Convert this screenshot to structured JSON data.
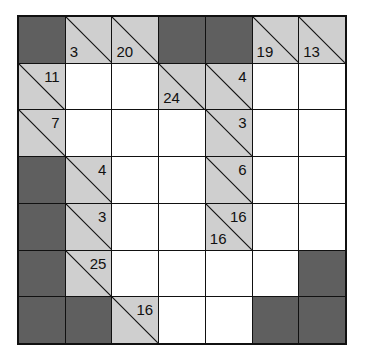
{
  "puzzle": {
    "type": "kakuro",
    "rows": 7,
    "cols": 7,
    "colors": {
      "block": "#5f5f5f",
      "clue": "#cfcfcf",
      "empty": "#ffffff",
      "line": "#111111"
    },
    "grid": [
      [
        {
          "t": "block"
        },
        {
          "t": "clue",
          "down": "3"
        },
        {
          "t": "clue",
          "down": "20"
        },
        {
          "t": "block"
        },
        {
          "t": "block"
        },
        {
          "t": "clue",
          "down": "19"
        },
        {
          "t": "clue",
          "down": "13"
        }
      ],
      [
        {
          "t": "clue",
          "across": "11"
        },
        {
          "t": "empty"
        },
        {
          "t": "empty"
        },
        {
          "t": "clue",
          "down": "24"
        },
        {
          "t": "clue",
          "across": "4"
        },
        {
          "t": "empty"
        },
        {
          "t": "empty"
        }
      ],
      [
        {
          "t": "clue",
          "across": "7"
        },
        {
          "t": "empty"
        },
        {
          "t": "empty"
        },
        {
          "t": "empty"
        },
        {
          "t": "clue",
          "across": "3"
        },
        {
          "t": "empty"
        },
        {
          "t": "empty"
        }
      ],
      [
        {
          "t": "block"
        },
        {
          "t": "clue",
          "across": "4"
        },
        {
          "t": "empty"
        },
        {
          "t": "empty"
        },
        {
          "t": "clue",
          "across": "6"
        },
        {
          "t": "empty"
        },
        {
          "t": "empty"
        }
      ],
      [
        {
          "t": "block"
        },
        {
          "t": "clue",
          "across": "3"
        },
        {
          "t": "empty"
        },
        {
          "t": "empty"
        },
        {
          "t": "clue",
          "across": "16",
          "down": "16"
        },
        {
          "t": "empty"
        },
        {
          "t": "empty"
        }
      ],
      [
        {
          "t": "block"
        },
        {
          "t": "clue",
          "across": "25"
        },
        {
          "t": "empty"
        },
        {
          "t": "empty"
        },
        {
          "t": "empty"
        },
        {
          "t": "empty"
        },
        {
          "t": "block"
        }
      ],
      [
        {
          "t": "block"
        },
        {
          "t": "block"
        },
        {
          "t": "clue",
          "across": "16"
        },
        {
          "t": "empty"
        },
        {
          "t": "empty"
        },
        {
          "t": "block"
        },
        {
          "t": "block"
        }
      ]
    ]
  }
}
